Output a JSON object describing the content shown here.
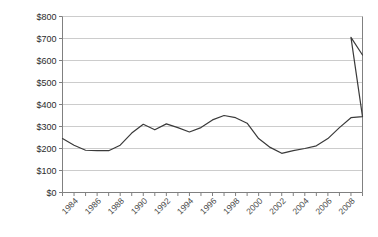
{
  "chart_data": {
    "type": "line",
    "title": "",
    "subtitle": "",
    "xlabel": "",
    "ylabel": "",
    "xlim": [
      1983,
      2009
    ],
    "ylim": [
      0,
      800
    ],
    "grid": true,
    "legend": false,
    "y_ticks": [
      0,
      100,
      200,
      300,
      400,
      500,
      600,
      700,
      800
    ],
    "y_tick_labels": [
      "$0",
      "$100",
      "$200",
      "$300",
      "$400",
      "$500",
      "$600",
      "$700",
      "$800"
    ],
    "x_ticks": [
      1983,
      1984,
      1985,
      1986,
      1987,
      1988,
      1989,
      1990,
      1991,
      1992,
      1993,
      1994,
      1995,
      1996,
      1997,
      1998,
      1999,
      2000,
      2001,
      2002,
      2003,
      2004,
      2005,
      2006,
      2007,
      2008,
      2009
    ],
    "x_tick_labels": [
      "1984",
      "1986",
      "1988",
      "1990",
      "1992",
      "1994",
      "1996",
      "1998",
      "2000",
      "2002",
      "2004",
      "2006",
      "2008"
    ],
    "x_tick_label_values": [
      1984,
      1986,
      1988,
      1990,
      1992,
      1994,
      1996,
      1998,
      2000,
      2002,
      2004,
      2006,
      2008
    ],
    "x_tick_label_rotation": -45,
    "series": [
      {
        "name": "value",
        "color": "#3a3a3a",
        "x": [
          1983,
          1984,
          1985,
          1986,
          1987,
          1988,
          1989,
          1990,
          1991,
          1992,
          1993,
          1994,
          1995,
          1996,
          1997,
          1998,
          1999,
          2000,
          2001,
          2002,
          2003,
          2004,
          2005,
          2006,
          2007,
          2008,
          2009
        ],
        "values": [
          245,
          215,
          192,
          190,
          190,
          215,
          270,
          310,
          285,
          312,
          295,
          275,
          295,
          330,
          350,
          340,
          315,
          245,
          205,
          178,
          190,
          200,
          212,
          245,
          295,
          340,
          345
        ]
      }
    ],
    "spike": {
      "x": [
        2008,
        2009
      ],
      "values": [
        705,
        625
      ]
    },
    "colors": {
      "line": "#3a3a3a",
      "grid": "#bfbfbf",
      "axis": "#808080",
      "background": "#ffffff",
      "tick_label": "#4a4a4a"
    }
  }
}
